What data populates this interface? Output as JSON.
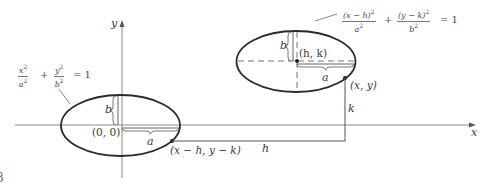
{
  "figure": {
    "number_fragment": "8",
    "colors": {
      "ink": "#2b2b2b",
      "axis": "#8a8a8a",
      "text": "#3a3a3a",
      "background": "#ffffff"
    }
  },
  "axes": {
    "x_label": "x",
    "y_label": "y"
  },
  "left_ellipse": {
    "equation": {
      "term1_num": "x",
      "term1_den": "a",
      "plus": "+",
      "term2_num": "y",
      "term2_den": "b",
      "exp": "2",
      "equals": "= 1"
    },
    "center_label": "(0, 0)",
    "semi_minor_label": "b",
    "semi_major_label": "a",
    "point_label": "(x − h, y − k)"
  },
  "right_ellipse": {
    "equation": {
      "term1_num": "(x − h)",
      "term1_den": "a",
      "plus": "+",
      "term2_num": "(y − k)",
      "term2_den": "b",
      "exp": "2",
      "equals": "= 1"
    },
    "center_label": "(h, k)",
    "semi_minor_label": "b",
    "semi_major_label": "a",
    "point_label": "(x, y)"
  },
  "translation": {
    "horizontal_label": "h",
    "vertical_label": "k"
  }
}
